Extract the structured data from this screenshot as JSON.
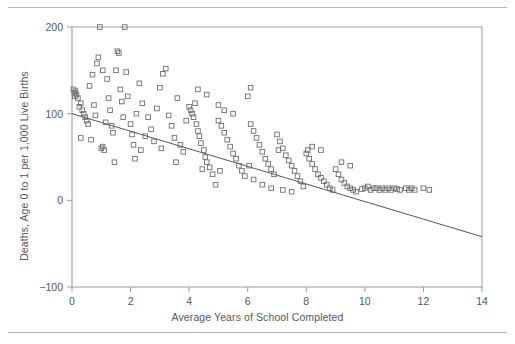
{
  "figure": {
    "rules": {
      "top_label": "page-rule-top",
      "bottom_label": "page-rule-bottom"
    }
  },
  "chart_data": {
    "type": "scatter",
    "title": "",
    "xlabel": "Average Years of School Completed",
    "ylabel": "Deaths, Age 0 to 1 per 1,000 Live Births",
    "xlim": [
      0,
      14
    ],
    "ylim": [
      -100,
      200
    ],
    "xticks": [
      0,
      2,
      4,
      6,
      8,
      10,
      12,
      14
    ],
    "yticks": [
      -100,
      0,
      100,
      200
    ],
    "xticklabels": [
      "0",
      "2",
      "4",
      "6",
      "8",
      "10",
      "12",
      "14"
    ],
    "yticklabels": [
      "−100",
      "0",
      "100",
      "200"
    ],
    "grid": false,
    "legend": null,
    "marker": "open-square",
    "marker_color": "#6e6e70",
    "trendline": {
      "label": "least-squares regression line",
      "x": [
        0,
        14
      ],
      "y": [
        100,
        -42
      ],
      "color": "#58585a"
    },
    "points": [
      [
        0.05,
        128
      ],
      [
        0.08,
        124
      ],
      [
        0.1,
        120
      ],
      [
        0.12,
        126
      ],
      [
        0.15,
        122
      ],
      [
        0.2,
        118
      ],
      [
        0.25,
        108
      ],
      [
        0.3,
        112
      ],
      [
        0.35,
        104
      ],
      [
        0.4,
        100
      ],
      [
        0.45,
        96
      ],
      [
        0.5,
        92
      ],
      [
        0.55,
        88
      ],
      [
        0.3,
        72
      ],
      [
        0.6,
        132
      ],
      [
        0.7,
        145
      ],
      [
        0.75,
        110
      ],
      [
        0.8,
        98
      ],
      [
        0.85,
        158
      ],
      [
        0.9,
        165
      ],
      [
        0.95,
        200
      ],
      [
        1.0,
        60
      ],
      [
        1.05,
        62
      ],
      [
        1.1,
        58
      ],
      [
        1.15,
        90
      ],
      [
        1.2,
        140
      ],
      [
        1.25,
        118
      ],
      [
        1.3,
        104
      ],
      [
        1.35,
        86
      ],
      [
        1.4,
        78
      ],
      [
        1.5,
        150
      ],
      [
        1.55,
        172
      ],
      [
        1.6,
        170
      ],
      [
        1.65,
        128
      ],
      [
        1.7,
        114
      ],
      [
        1.75,
        96
      ],
      [
        1.8,
        200
      ],
      [
        1.85,
        148
      ],
      [
        1.9,
        120
      ],
      [
        2.0,
        88
      ],
      [
        2.05,
        76
      ],
      [
        2.1,
        64
      ],
      [
        2.2,
        100
      ],
      [
        2.3,
        135
      ],
      [
        2.4,
        112
      ],
      [
        2.5,
        74
      ],
      [
        2.6,
        96
      ],
      [
        2.7,
        82
      ],
      [
        2.8,
        68
      ],
      [
        2.9,
        106
      ],
      [
        3.0,
        130
      ],
      [
        3.1,
        146
      ],
      [
        3.2,
        152
      ],
      [
        3.3,
        98
      ],
      [
        3.4,
        86
      ],
      [
        3.5,
        72
      ],
      [
        3.6,
        118
      ],
      [
        3.7,
        64
      ],
      [
        3.8,
        56
      ],
      [
        3.9,
        92
      ],
      [
        4.0,
        108
      ],
      [
        4.05,
        104
      ],
      [
        4.1,
        100
      ],
      [
        4.15,
        96
      ],
      [
        4.2,
        112
      ],
      [
        4.25,
        88
      ],
      [
        4.3,
        80
      ],
      [
        4.35,
        74
      ],
      [
        4.4,
        66
      ],
      [
        4.5,
        58
      ],
      [
        4.55,
        50
      ],
      [
        4.6,
        44
      ],
      [
        4.7,
        38
      ],
      [
        4.8,
        30
      ],
      [
        4.9,
        18
      ],
      [
        4.3,
        128
      ],
      [
        4.6,
        122
      ],
      [
        5.0,
        92
      ],
      [
        5.1,
        86
      ],
      [
        5.2,
        78
      ],
      [
        5.3,
        70
      ],
      [
        5.4,
        62
      ],
      [
        5.5,
        54
      ],
      [
        5.6,
        48
      ],
      [
        5.7,
        40
      ],
      [
        5.8,
        34
      ],
      [
        5.9,
        28
      ],
      [
        5.0,
        110
      ],
      [
        5.2,
        104
      ],
      [
        5.5,
        100
      ],
      [
        6.0,
        120
      ],
      [
        6.1,
        88
      ],
      [
        6.2,
        80
      ],
      [
        6.3,
        72
      ],
      [
        6.4,
        64
      ],
      [
        6.5,
        56
      ],
      [
        6.6,
        48
      ],
      [
        6.7,
        42
      ],
      [
        6.8,
        36
      ],
      [
        6.9,
        30
      ],
      [
        6.2,
        24
      ],
      [
        6.5,
        18
      ],
      [
        6.8,
        14
      ],
      [
        7.0,
        76
      ],
      [
        7.1,
        68
      ],
      [
        7.2,
        60
      ],
      [
        7.3,
        52
      ],
      [
        7.4,
        46
      ],
      [
        7.5,
        40
      ],
      [
        7.6,
        34
      ],
      [
        7.7,
        28
      ],
      [
        7.8,
        22
      ],
      [
        7.9,
        16
      ],
      [
        7.2,
        12
      ],
      [
        7.5,
        10
      ],
      [
        8.0,
        54
      ],
      [
        8.1,
        48
      ],
      [
        8.2,
        42
      ],
      [
        8.3,
        36
      ],
      [
        8.4,
        30
      ],
      [
        8.5,
        26
      ],
      [
        8.6,
        22
      ],
      [
        8.7,
        18
      ],
      [
        8.8,
        14
      ],
      [
        8.9,
        12
      ],
      [
        8.2,
        62
      ],
      [
        8.5,
        58
      ],
      [
        9.0,
        36
      ],
      [
        9.1,
        30
      ],
      [
        9.2,
        24
      ],
      [
        9.3,
        20
      ],
      [
        9.4,
        16
      ],
      [
        9.5,
        14
      ],
      [
        9.6,
        12
      ],
      [
        9.7,
        10
      ],
      [
        9.2,
        44
      ],
      [
        9.5,
        40
      ],
      [
        10.0,
        14
      ],
      [
        10.2,
        12
      ],
      [
        10.4,
        14
      ],
      [
        10.5,
        12
      ],
      [
        10.6,
        14
      ],
      [
        10.7,
        12
      ],
      [
        10.8,
        14
      ],
      [
        10.9,
        12
      ],
      [
        10.1,
        16
      ],
      [
        11.0,
        14
      ],
      [
        11.2,
        12
      ],
      [
        11.4,
        14
      ],
      [
        11.5,
        12
      ],
      [
        11.6,
        14
      ],
      [
        11.7,
        12
      ],
      [
        12.0,
        14
      ],
      [
        12.2,
        12
      ],
      [
        6.1,
        130
      ],
      [
        10.3,
        14
      ],
      [
        11.1,
        13
      ],
      [
        9.9,
        13
      ],
      [
        8.05,
        58
      ],
      [
        7.05,
        58
      ],
      [
        4.45,
        36
      ],
      [
        3.55,
        44
      ],
      [
        2.35,
        58
      ],
      [
        1.45,
        44
      ],
      [
        0.65,
        70
      ],
      [
        5.05,
        34
      ],
      [
        6.05,
        40
      ],
      [
        3.05,
        60
      ],
      [
        2.15,
        48
      ],
      [
        1.05,
        150
      ]
    ]
  }
}
